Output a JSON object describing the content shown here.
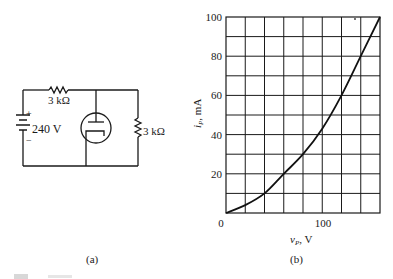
{
  "circuit": {
    "panel_label": "(a)",
    "source_voltage": "240 V",
    "source_plus": "+",
    "source_minus": "−",
    "series_resistor": "3 kΩ",
    "shunt_resistor": "3 kΩ",
    "device": "vacuum-tube-diode"
  },
  "chart_panel_label": "(b)",
  "chart_data": {
    "type": "line",
    "title": "",
    "xlabel": "v_P, V",
    "ylabel": "i_P, mA",
    "xlim": [
      0,
      160
    ],
    "ylim": [
      0,
      100
    ],
    "grid": true,
    "x_ticks_labeled": [
      0,
      100
    ],
    "y_ticks_labeled": [
      20,
      40,
      60,
      80,
      100
    ],
    "x_grid_step": 20,
    "y_grid_step": 10,
    "series": [
      {
        "name": "diode characteristic",
        "x": [
          0,
          20,
          40,
          60,
          80,
          100,
          120,
          140,
          160
        ],
        "y": [
          0,
          4,
          10,
          20,
          30,
          43,
          60,
          80,
          100
        ]
      }
    ]
  },
  "axis_labels": {
    "y_name": "i",
    "y_sub": "P",
    "y_unit": ", mA",
    "x_name": "v",
    "x_sub": "P",
    "x_unit": ", V",
    "x0": "0",
    "x100": "100",
    "y20": "20",
    "y40": "40",
    "y60": "60",
    "y80": "80",
    "y100": "100"
  }
}
